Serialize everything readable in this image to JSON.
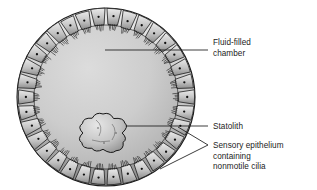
{
  "figure": {
    "kind": "biological-diagram",
    "background_color": "#ffffff",
    "outline_color": "#1a1a1a",
    "chamber_fill_light": "#d8d8d8",
    "chamber_fill_dark": "#b4b4b4",
    "cell_fill_light": "#e2e2e2",
    "cell_fill_dark": "#8f8f8f",
    "statolith_fill_light": "#dedede",
    "statolith_fill_dark": "#9a9a9a",
    "nucleus_color": "#101010"
  },
  "geometry": {
    "circle": {
      "cx": 106,
      "cy": 97,
      "r": 89
    },
    "cell_band_thickness": 17,
    "cell_count": 34,
    "cilia_per_cell": 5,
    "statolith": {
      "cx": 103,
      "cy": 133,
      "rx": 24,
      "ry": 19
    }
  },
  "labels": [
    {
      "id": "fluid-filled-chamber",
      "lines": [
        "Fluid-filled",
        "chamber"
      ],
      "text_x": 213,
      "text_y": 45,
      "leader": {
        "type": "line",
        "x1": 105,
        "y1": 50,
        "x2": 208,
        "y2": 50
      }
    },
    {
      "id": "statolith",
      "lines": [
        "Statolith"
      ],
      "text_x": 213,
      "text_y": 129,
      "leader": {
        "type": "line",
        "x1": 126,
        "y1": 126,
        "x2": 208,
        "y2": 126
      }
    },
    {
      "id": "sensory-epithelium",
      "lines": [
        "Sensory epithelium",
        "containing",
        "nonmotile cilia"
      ],
      "text_x": 213,
      "text_y": 148,
      "leader": {
        "type": "fork",
        "vertex_x": 208,
        "vertex_y": 145,
        "branch_a": {
          "x": 178,
          "y": 127
        },
        "branch_b": {
          "x": 160,
          "y": 169
        }
      }
    }
  ]
}
